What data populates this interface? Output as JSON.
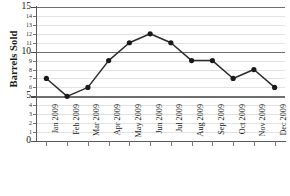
{
  "chart_data": {
    "type": "line",
    "title": "",
    "xlabel": "",
    "ylabel": "Barrels Sold",
    "categories": [
      "Jan 2009",
      "Feb 2009",
      "Mar 2009",
      "Apr 2009",
      "May 2009",
      "Jun 2009",
      "Jul 2009",
      "Aug 2009",
      "Sep 2009",
      "Oct 2009",
      "Nov 2009",
      "Dec 2009"
    ],
    "values": [
      7,
      5,
      6,
      9,
      11,
      12,
      11,
      9,
      9,
      7,
      8,
      6
    ],
    "series": [
      {
        "name": "Barrels Sold",
        "values": [
          7,
          5,
          6,
          9,
          11,
          12,
          11,
          9,
          9,
          7,
          8,
          6
        ]
      }
    ],
    "ylim": [
      0,
      15
    ],
    "y_ticks": [
      0,
      1,
      2,
      3,
      4,
      5,
      6,
      7,
      8,
      9,
      10,
      11,
      12,
      13,
      14,
      15
    ],
    "y_major_ticks": [
      0,
      5,
      10,
      15
    ],
    "y_tick_labels": [
      "0",
      "1",
      "2",
      "3",
      "4",
      "5",
      "6",
      "7",
      "8",
      "9",
      "10",
      "11",
      "12",
      "13",
      "14",
      "15"
    ],
    "grid": true,
    "legend": "none",
    "marker": "circle",
    "line_color": "#2b2b2b",
    "marker_color": "#1a1a1a",
    "major_gridline_color": "#6f6f6f",
    "minor_gridline_color": "#e2e2e2",
    "axis_color": "#5a5a5a",
    "background_color": "#ffffff"
  }
}
